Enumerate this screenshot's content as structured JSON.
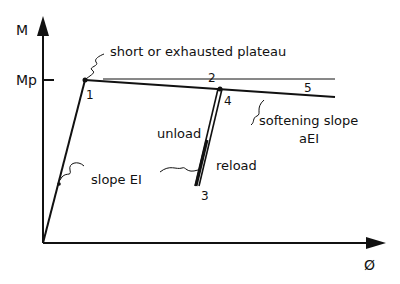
{
  "diagram": {
    "type": "moment-curvature",
    "y_axis_label": "M",
    "y_tick_label": "Mp",
    "x_axis_label": "Ø",
    "annotations": {
      "plateau": "short or exhausted plateau",
      "elastic_slope": "slope EI",
      "softening_line1": "softening slope",
      "softening_line2": "aEI",
      "unload": "unload",
      "reload": "reload"
    },
    "points": {
      "p1": "1",
      "p2": "2",
      "p3": "3",
      "p4": "4",
      "p5": "5"
    },
    "colors": {
      "ink": "#111111",
      "background": "#ffffff"
    }
  }
}
